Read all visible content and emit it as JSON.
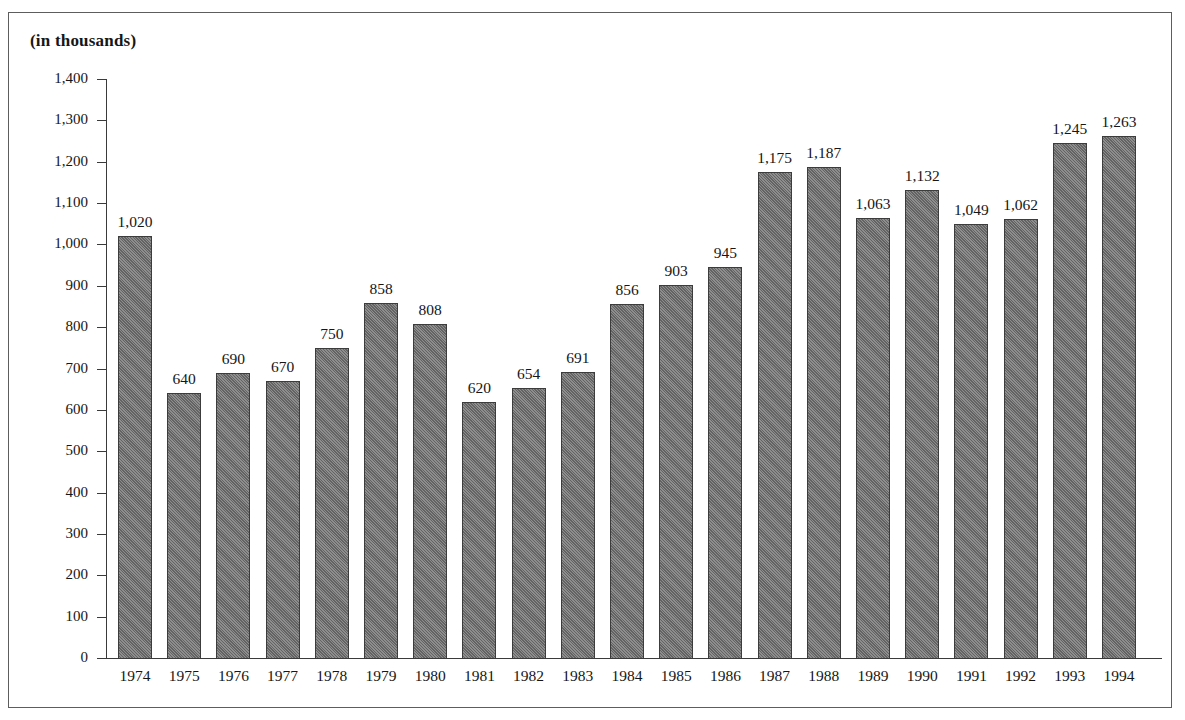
{
  "figure": {
    "title": "(in thousands)",
    "frame_color": "#5d5d5d",
    "background": "#ffffff"
  },
  "axes": {
    "y_ticks": [
      "1,400",
      "1,300",
      "1,200",
      "1,100",
      "1,000",
      "900",
      "800",
      "700",
      "600",
      "500",
      "400",
      "300",
      "200",
      "100",
      "0"
    ]
  },
  "chart_data": {
    "type": "bar",
    "title": "(in thousands)",
    "xlabel": "",
    "ylabel": "(in thousands)",
    "ylim": [
      0,
      1400
    ],
    "ytick_step": 100,
    "grid": false,
    "legend": false,
    "bar_color": "#6e6e6e",
    "bar_edge_color": "#3c3c3c",
    "categories": [
      "1974",
      "1975",
      "1976",
      "1977",
      "1978",
      "1979",
      "1980",
      "1981",
      "1982",
      "1983",
      "1984",
      "1985",
      "1986",
      "1987",
      "1988",
      "1989",
      "1990",
      "1991",
      "1992",
      "1993",
      "1994"
    ],
    "values": [
      1020,
      640,
      690,
      670,
      750,
      858,
      808,
      620,
      654,
      691,
      856,
      903,
      945,
      1175,
      1187,
      1063,
      1132,
      1049,
      1062,
      1245,
      1263
    ],
    "value_labels": [
      "1,020",
      "640",
      "690",
      "670",
      "750",
      "858",
      "808",
      "620",
      "654",
      "691",
      "856",
      "903",
      "945",
      "1,175",
      "1,187",
      "1,063",
      "1,132",
      "1,049",
      "1,062",
      "1,245",
      "1,263"
    ]
  }
}
